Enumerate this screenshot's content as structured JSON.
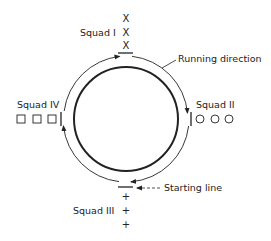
{
  "diagram": {
    "labels": {
      "squad_1": "Squad I",
      "squad_2": "Squad II",
      "squad_3": "Squad III",
      "squad_4": "Squad IV",
      "running_direction": "Running direction",
      "starting_line": "Starting line"
    },
    "squads": [
      {
        "name": "Squad I",
        "position": "top",
        "marker": "X",
        "count": 3
      },
      {
        "name": "Squad II",
        "position": "right",
        "marker": "circle",
        "count": 3
      },
      {
        "name": "Squad III",
        "position": "bottom",
        "marker": "+",
        "count": 3
      },
      {
        "name": "Squad IV",
        "position": "left",
        "marker": "square",
        "count": 3
      }
    ],
    "markers": {
      "x": "X",
      "plus": "+"
    },
    "colors": {
      "ink": "#222222",
      "background": "#ffffff"
    }
  }
}
